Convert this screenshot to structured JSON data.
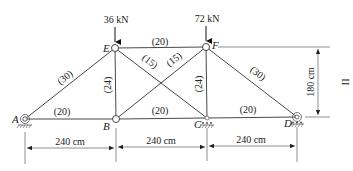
{
  "diagram": {
    "type": "truss",
    "nodes": [
      {
        "id": "A",
        "label": "A",
        "x": 25,
        "y": 119,
        "support": "pin"
      },
      {
        "id": "B",
        "label": "B",
        "x": 116,
        "y": 119,
        "support": "none"
      },
      {
        "id": "C",
        "label": "C",
        "x": 207,
        "y": 118,
        "support": "roller"
      },
      {
        "id": "D",
        "label": "D",
        "x": 297,
        "y": 117,
        "support": "roller"
      },
      {
        "id": "E",
        "label": "E",
        "x": 115,
        "y": 48,
        "support": "none"
      },
      {
        "id": "F",
        "label": "F",
        "x": 206,
        "y": 47,
        "support": "none"
      }
    ],
    "members": [
      {
        "from": "A",
        "to": "B",
        "label": "(20)"
      },
      {
        "from": "B",
        "to": "C",
        "label": "(20)"
      },
      {
        "from": "C",
        "to": "D",
        "label": "(20)"
      },
      {
        "from": "E",
        "to": "F",
        "label": "(20)"
      },
      {
        "from": "A",
        "to": "E",
        "label": "(30)"
      },
      {
        "from": "F",
        "to": "D",
        "label": "(30)"
      },
      {
        "from": "E",
        "to": "B",
        "label": "(24)"
      },
      {
        "from": "F",
        "to": "C",
        "label": "(24)"
      },
      {
        "from": "E",
        "to": "C",
        "label": "(15)"
      },
      {
        "from": "B",
        "to": "F",
        "label": "(15)"
      }
    ],
    "loads": [
      {
        "node": "E",
        "label": "36 kN"
      },
      {
        "node": "F",
        "label": "72 kN"
      }
    ],
    "dimensions": {
      "spans": [
        "240 cm",
        "240 cm",
        "240 cm"
      ],
      "height": "180 cm"
    },
    "side_mark": "II"
  }
}
